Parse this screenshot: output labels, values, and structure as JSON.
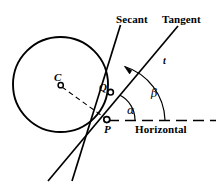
{
  "figure": {
    "background_color": "#ffffff",
    "stroke_color": "#000000",
    "width": 219,
    "height": 189,
    "labels": {
      "secant": "Secant",
      "tangent": "Tangent",
      "horizontal": "Horizontal",
      "center_point": "C",
      "secant_point": "Q",
      "tangency_point": "P",
      "tangent_line_symbol": "t",
      "angle_alpha": "α",
      "angle_beta": "β"
    },
    "geometry": {
      "circle": {
        "cx": 60.5,
        "cy": 84.5,
        "r": 47.5
      },
      "point_P": {
        "x": 107,
        "y": 120
      },
      "point_Q": {
        "x": 110.5,
        "y": 92
      },
      "point_C": {
        "x": 60.5,
        "y": 84.5
      },
      "horizontal_line": {
        "x1": 107,
        "y1": 120,
        "x2": 216,
        "y2": 120,
        "style": "dashed"
      },
      "radius_line": {
        "x1": 61,
        "y1": 85,
        "x2": 106,
        "y2": 119,
        "style": "dashed"
      },
      "secant_line": {
        "x1": 120,
        "y1": 25,
        "x2": 72,
        "y2": 181
      },
      "tangent_line": {
        "x1": 178,
        "y1": 26,
        "x2": 48,
        "y2": 181
      },
      "alpha_arc": {
        "cx": 107,
        "cy": 120,
        "r": 28,
        "start_deg": 0,
        "end_deg": 50
      },
      "beta_arc": {
        "cx": 107,
        "cy": 120,
        "r": 58,
        "start_deg": 0,
        "end_deg": 50
      }
    },
    "annotations": {
      "alpha_meaning": "angle between secant and horizontal",
      "beta_meaning": "angle between tangent and horizontal"
    }
  }
}
